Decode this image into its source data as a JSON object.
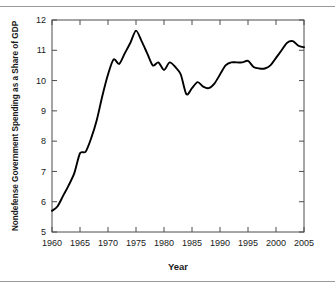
{
  "figure": {
    "background_color": "#ffffff",
    "line_color": "#000000",
    "axis_color": "#4d4d4d",
    "rule_color": "#9a9a9a"
  },
  "axes": {
    "x_title": "Year",
    "y_title": "Nondefense Government Spending as a Share of GDP",
    "x_ticks": [
      "1960",
      "1965",
      "1970",
      "1975",
      "1980",
      "1985",
      "1990",
      "1995",
      "2000",
      "2005"
    ],
    "y_ticks": [
      "5",
      "6",
      "7",
      "8",
      "9",
      "10",
      "11",
      "12"
    ]
  },
  "chart_data": {
    "type": "line",
    "title": "",
    "xlabel": "Year",
    "ylabel": "Nondefense Government Spending as a Share of GDP",
    "xlim": [
      1960,
      2005
    ],
    "ylim": [
      5,
      12
    ],
    "grid": false,
    "legend": "none",
    "x": [
      1960,
      1961,
      1962,
      1963,
      1964,
      1965,
      1966,
      1967,
      1968,
      1969,
      1970,
      1971,
      1972,
      1973,
      1974,
      1975,
      1976,
      1977,
      1978,
      1979,
      1980,
      1981,
      1982,
      1983,
      1984,
      1985,
      1986,
      1987,
      1988,
      1989,
      1990,
      1991,
      1992,
      1993,
      1994,
      1995,
      1996,
      1997,
      1998,
      1999,
      2000,
      2001,
      2002,
      2003,
      2004,
      2005
    ],
    "series": [
      {
        "name": "Nondefense Government Spending as a Share of GDP",
        "values": [
          5.7,
          5.85,
          6.2,
          6.55,
          6.95,
          7.6,
          7.65,
          8.1,
          8.7,
          9.5,
          10.2,
          10.7,
          10.55,
          10.9,
          11.25,
          11.65,
          11.3,
          10.9,
          10.5,
          10.6,
          10.35,
          10.6,
          10.45,
          10.2,
          9.55,
          9.75,
          9.95,
          9.8,
          9.75,
          9.9,
          10.2,
          10.5,
          10.6,
          10.6,
          10.6,
          10.65,
          10.45,
          10.4,
          10.4,
          10.5,
          10.75,
          11.0,
          11.25,
          11.3,
          11.15,
          11.1
        ]
      }
    ]
  }
}
